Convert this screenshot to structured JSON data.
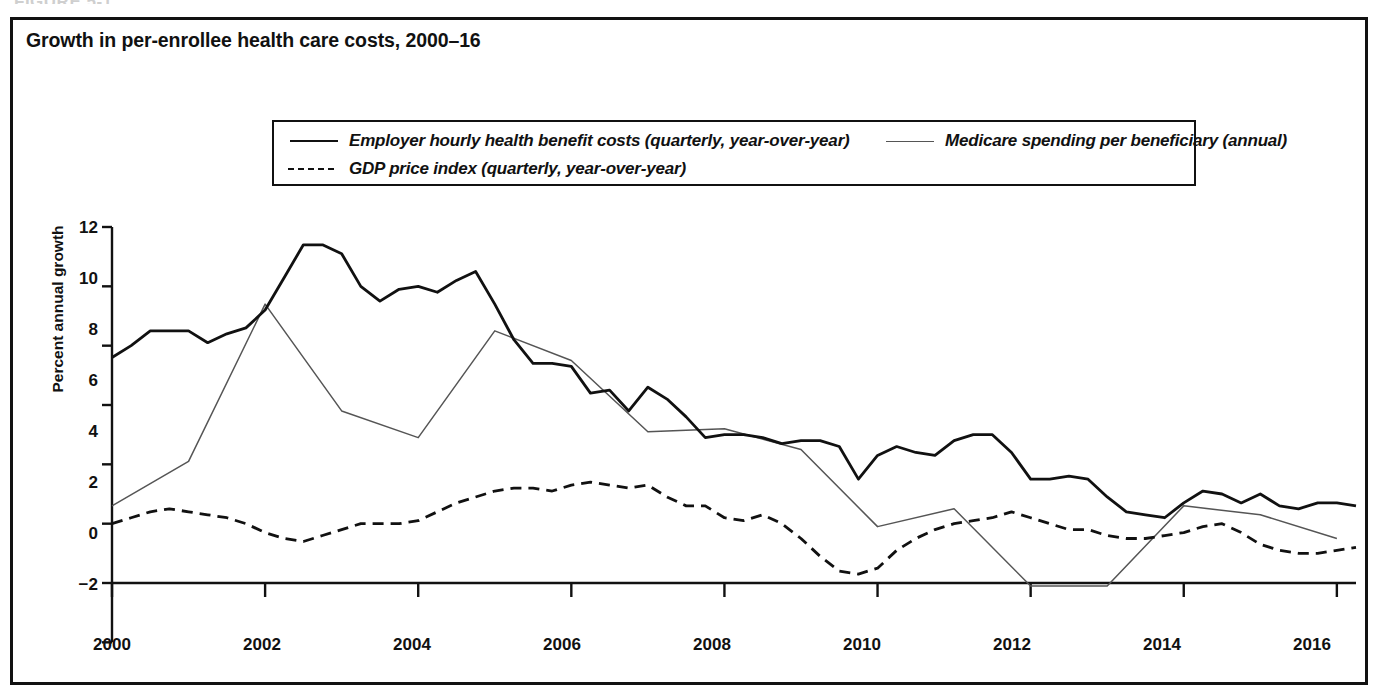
{
  "figure_label": "FIGURE 5-1",
  "chart_title": "Growth in per-enrollee health care costs, 2000–16",
  "legend": {
    "entries": [
      {
        "key": "solid-line",
        "label": "Employer hourly health benefit costs (quarterly, year-over-year)"
      },
      {
        "key": "dashed-line",
        "label": "GDP price index (quarterly, year-over-year)"
      },
      {
        "key": "thin-line",
        "label": "Medicare spending per beneficiary (annual)"
      }
    ]
  },
  "axes": {
    "ylabel": "Percent annual growth",
    "yticks": [
      "12",
      "10",
      "8",
      "6",
      "4",
      "2",
      "0",
      "−2"
    ],
    "xticks": [
      "2000",
      "2002",
      "2004",
      "2006",
      "2008",
      "2010",
      "2012",
      "2014",
      "2016"
    ]
  },
  "chart_data": {
    "type": "line",
    "title": "Growth in per-enrollee health care costs, 2000–16",
    "xlabel": "",
    "ylabel": "Percent annual growth",
    "xlim": [
      2000,
      2016.25
    ],
    "ylim": [
      -2,
      12
    ],
    "grid": false,
    "legend_position": "top-center-inside-box",
    "xticks": [
      2000,
      2002,
      2004,
      2006,
      2008,
      2010,
      2012,
      2014,
      2016
    ],
    "yticks": [
      -2,
      0,
      2,
      4,
      6,
      8,
      10,
      12
    ],
    "series": [
      {
        "name": "Employer hourly health benefit costs (quarterly, year-over-year)",
        "style": "solid",
        "color": "#111111",
        "x": [
          2000.0,
          2000.25,
          2000.5,
          2000.75,
          2001.0,
          2001.25,
          2001.5,
          2001.75,
          2002.0,
          2002.25,
          2002.5,
          2002.75,
          2003.0,
          2003.25,
          2003.5,
          2003.75,
          2004.0,
          2004.25,
          2004.5,
          2004.75,
          2005.0,
          2005.25,
          2005.5,
          2005.75,
          2006.0,
          2006.25,
          2006.5,
          2006.75,
          2007.0,
          2007.25,
          2007.5,
          2007.75,
          2008.0,
          2008.25,
          2008.5,
          2008.75,
          2009.0,
          2009.25,
          2009.5,
          2009.75,
          2010.0,
          2010.25,
          2010.5,
          2010.75,
          2011.0,
          2011.25,
          2011.5,
          2011.75,
          2012.0,
          2012.25,
          2012.5,
          2012.75,
          2013.0,
          2013.25,
          2013.5,
          2013.75,
          2014.0,
          2014.25,
          2014.5,
          2014.75,
          2015.0,
          2015.25,
          2015.5,
          2015.75,
          2016.0,
          2016.25
        ],
        "values": [
          7.6,
          8.0,
          8.5,
          8.5,
          8.5,
          8.1,
          8.4,
          8.6,
          9.2,
          10.3,
          11.4,
          11.4,
          11.1,
          10.0,
          9.5,
          9.9,
          10.0,
          9.8,
          10.2,
          10.5,
          9.4,
          8.2,
          7.4,
          7.4,
          7.3,
          6.4,
          6.5,
          5.8,
          6.6,
          6.2,
          5.6,
          4.9,
          5.0,
          5.0,
          4.9,
          4.7,
          4.8,
          4.8,
          4.6,
          3.5,
          4.3,
          4.6,
          4.4,
          4.3,
          4.8,
          5.0,
          5.0,
          4.4,
          3.5,
          3.5,
          3.6,
          3.5,
          2.9,
          2.4,
          2.3,
          2.2,
          2.7,
          3.1,
          3.0,
          2.7,
          3.0,
          2.6,
          2.5,
          2.7,
          2.7,
          2.6
        ]
      },
      {
        "name": "GDP price index (quarterly, year-over-year)",
        "style": "dashed",
        "color": "#111111",
        "x": [
          2000.0,
          2000.25,
          2000.5,
          2000.75,
          2001.0,
          2001.25,
          2001.5,
          2001.75,
          2002.0,
          2002.25,
          2002.5,
          2002.75,
          2003.0,
          2003.25,
          2003.5,
          2003.75,
          2004.0,
          2004.25,
          2004.5,
          2004.75,
          2005.0,
          2005.25,
          2005.5,
          2005.75,
          2006.0,
          2006.25,
          2006.5,
          2006.75,
          2007.0,
          2007.25,
          2007.5,
          2007.75,
          2008.0,
          2008.25,
          2008.5,
          2008.75,
          2009.0,
          2009.25,
          2009.5,
          2009.75,
          2010.0,
          2010.25,
          2010.5,
          2010.75,
          2011.0,
          2011.25,
          2011.5,
          2011.75,
          2012.0,
          2012.25,
          2012.5,
          2012.75,
          2013.0,
          2013.25,
          2013.5,
          2013.75,
          2014.0,
          2014.25,
          2014.5,
          2014.75,
          2015.0,
          2015.25,
          2015.5,
          2015.75,
          2016.0,
          2016.25
        ],
        "values": [
          2.0,
          2.2,
          2.4,
          2.5,
          2.4,
          2.3,
          2.2,
          2.0,
          1.7,
          1.5,
          1.4,
          1.6,
          1.8,
          2.0,
          2.0,
          2.0,
          2.1,
          2.4,
          2.7,
          2.9,
          3.1,
          3.2,
          3.2,
          3.1,
          3.3,
          3.4,
          3.3,
          3.2,
          3.3,
          2.9,
          2.6,
          2.6,
          2.2,
          2.1,
          2.3,
          2.0,
          1.5,
          0.9,
          0.4,
          0.3,
          0.5,
          1.1,
          1.5,
          1.8,
          2.0,
          2.1,
          2.2,
          2.4,
          2.2,
          2.0,
          1.8,
          1.8,
          1.6,
          1.5,
          1.5,
          1.6,
          1.7,
          1.9,
          2.0,
          1.7,
          1.3,
          1.1,
          1.0,
          1.0,
          1.1,
          1.2
        ]
      },
      {
        "name": "Medicare spending per beneficiary (annual)",
        "style": "thin",
        "color": "#555555",
        "x": [
          2000,
          2001,
          2002,
          2003,
          2004,
          2005,
          2006,
          2007,
          2008,
          2009,
          2010,
          2011,
          2012,
          2013,
          2014,
          2015,
          2016
        ],
        "values": [
          2.6,
          4.1,
          9.4,
          5.8,
          4.9,
          8.5,
          7.5,
          5.1,
          5.2,
          4.5,
          1.9,
          2.5,
          -0.1,
          -0.1,
          2.6,
          2.3,
          1.5
        ]
      }
    ]
  }
}
